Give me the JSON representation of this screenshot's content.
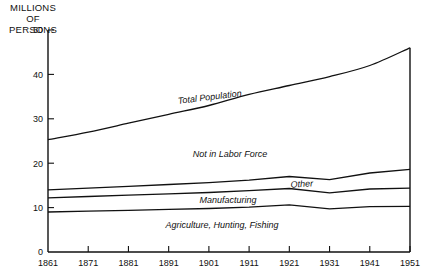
{
  "chart_data": {
    "type": "area",
    "title": "MILLIONS OF PERSONS",
    "title_lines": [
      "MILLIONS",
      "OF",
      "PERSONS"
    ],
    "xlabel": "",
    "ylabel": "MILLIONS OF PERSONS",
    "grid": false,
    "legend_position": "inline-labels",
    "stacked": true,
    "xlim": [
      1861,
      1951
    ],
    "ylim": [
      0,
      50
    ],
    "yticks": [
      0,
      10,
      20,
      30,
      40,
      50
    ],
    "ytick_labels": [
      "0",
      "10",
      "20",
      "30",
      "40",
      "50"
    ],
    "x": [
      1861,
      1871,
      1881,
      1891,
      1901,
      1911,
      1921,
      1931,
      1941,
      1951
    ],
    "xtick_labels": [
      "1861",
      "1871",
      "1881",
      "1891",
      "1901",
      "1911",
      "1921",
      "1931",
      "1941",
      "1951"
    ],
    "series": [
      {
        "name": "Agriculture, Hunting, Fishing",
        "cumulative_values": [
          9.0,
          9.2,
          9.4,
          9.6,
          9.8,
          10.1,
          10.6,
          9.7,
          10.2,
          10.3
        ]
      },
      {
        "name": "Manufacturing",
        "cumulative_values": [
          12.2,
          12.5,
          12.8,
          13.1,
          13.4,
          13.8,
          14.3,
          13.3,
          14.2,
          14.4
        ]
      },
      {
        "name": "Other",
        "cumulative_values": [
          14.0,
          14.4,
          14.8,
          15.2,
          15.6,
          16.2,
          17.0,
          16.3,
          17.8,
          18.6
        ]
      },
      {
        "name": "Not in Labor Force",
        "cumulative_values": [
          25.3,
          27.0,
          29.0,
          31.0,
          33.0,
          35.5,
          37.5,
          39.5,
          42.0,
          46.0
        ]
      }
    ],
    "band_labels": [
      {
        "text": "Total Population",
        "value": 1861
      },
      {
        "text": "Not in Labor Force",
        "value": 1891
      },
      {
        "text": "Other",
        "value": 1921
      },
      {
        "text": "Manufacturing",
        "value": 1891
      },
      {
        "text": "Agriculture, Hunting, Fishing",
        "value": 1891
      }
    ],
    "annotations": {
      "total_population": "Total Population",
      "not_in_labor_force": "Not in Labor Force",
      "other": "Other",
      "manufacturing": "Manufacturing",
      "agriculture": "Agriculture, Hunting, Fishing"
    },
    "colors": {
      "line": "#111111",
      "background": "#ffffff"
    }
  }
}
